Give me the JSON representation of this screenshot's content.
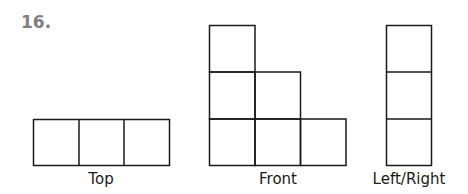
{
  "problem_number": "16.",
  "views": [
    {
      "name": "Top",
      "label": "Top",
      "cells": [
        [
          0,
          0
        ],
        [
          1,
          0
        ],
        [
          2,
          0
        ]
      ]
    },
    {
      "name": "Front",
      "label": "Front",
      "column_heights": [
        3,
        2,
        1
      ]
    },
    {
      "name": "Left/Right",
      "label": "Left/Right",
      "column_heights": [
        3
      ]
    }
  ],
  "colors": {
    "number": "#7f7f7f",
    "lines": "#1a1a1a"
  }
}
